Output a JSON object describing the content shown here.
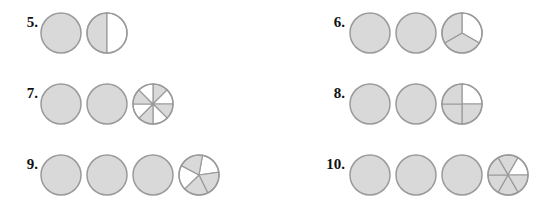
{
  "colors": {
    "shaded": "#d9d9d9",
    "unshaded": "#ffffff",
    "stroke": "#9a9a9a"
  },
  "problems": [
    {
      "label": "5.",
      "whole_circles": 1,
      "fraction": {
        "parts": 2,
        "shaded": [
          0
        ],
        "start_deg": 180
      },
      "value": "1 1/2"
    },
    {
      "label": "6.",
      "whole_circles": 2,
      "fraction": {
        "parts": 3,
        "shaded": [
          1,
          2
        ],
        "start_deg": 0
      },
      "value": "2 2/3"
    },
    {
      "label": "7.",
      "whole_circles": 2,
      "fraction": {
        "parts": 8,
        "shaded": [
          0,
          2,
          4,
          6
        ],
        "start_deg": 0
      },
      "value": "2 4/8"
    },
    {
      "label": "8.",
      "whole_circles": 2,
      "fraction": {
        "parts": 4,
        "shaded": [
          1,
          2,
          3
        ],
        "start_deg": 0
      },
      "value": "2 3/4"
    },
    {
      "label": "9.",
      "whole_circles": 3,
      "fraction": {
        "parts": 5,
        "shaded": [
          1,
          2,
          4
        ],
        "start_deg": 10
      },
      "value": "3 3/5"
    },
    {
      "label": "10.",
      "whole_circles": 3,
      "fraction": {
        "parts": 6,
        "shaded": [
          0,
          2,
          3,
          4,
          5
        ],
        "start_deg": -30
      },
      "value": "3 5/6"
    }
  ],
  "layout": {
    "positions": [
      {
        "x": 10,
        "y": 12,
        "cx": 40
      },
      {
        "x": 317,
        "y": 12,
        "cx": 349
      },
      {
        "x": 10,
        "y": 83,
        "cx": 40
      },
      {
        "x": 317,
        "y": 83,
        "cx": 349
      },
      {
        "x": 10,
        "y": 154,
        "cx": 40
      },
      {
        "x": 317,
        "y": 154,
        "cx": 349
      }
    ],
    "circle_spacing": 46,
    "diameter": 40
  }
}
